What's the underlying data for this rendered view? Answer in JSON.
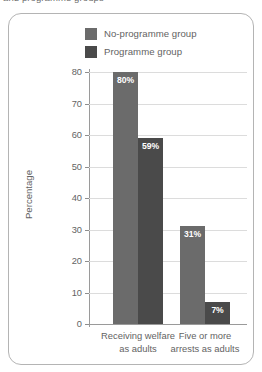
{
  "caption": {
    "partial_text": "and programme groups"
  },
  "legend": {
    "items": [
      {
        "label": "No-programme group",
        "color": "#6b6b6b",
        "swatch_name": "legend-swatch-no-programme"
      },
      {
        "label": "Programme group",
        "color": "#4a4a4a",
        "swatch_name": "legend-swatch-programme"
      }
    ]
  },
  "axes": {
    "y_title": "Percentage",
    "y_ticks": [
      "0",
      "10",
      "20",
      "30",
      "40",
      "50",
      "60",
      "70",
      "80"
    ],
    "x_categories": [
      {
        "line1": "Receiving welfare",
        "line2": "as adults"
      },
      {
        "line1": "Five or more",
        "line2": "arrests as adults"
      }
    ]
  },
  "bars": [
    {
      "group": 0,
      "series": "No-programme group",
      "value": 80,
      "label": "80%",
      "color": "#6b6b6b"
    },
    {
      "group": 0,
      "series": "Programme group",
      "value": 59,
      "label": "59%",
      "color": "#4a4a4a"
    },
    {
      "group": 1,
      "series": "No-programme group",
      "value": 31,
      "label": "31%",
      "color": "#6b6b6b"
    },
    {
      "group": 1,
      "series": "Programme group",
      "value": 7,
      "label": "7%",
      "color": "#4a4a4a"
    }
  ],
  "chart_data": {
    "type": "bar",
    "title": "",
    "xlabel": "",
    "ylabel": "Percentage",
    "ylim": [
      0,
      80
    ],
    "yticks": [
      0,
      10,
      20,
      30,
      40,
      50,
      60,
      70,
      80
    ],
    "grid": true,
    "legend_position": "top",
    "categories": [
      "Receiving welfare as adults",
      "Five or more arrests as adults"
    ],
    "series": [
      {
        "name": "No-programme group",
        "values": [
          80,
          31
        ],
        "color": "#6b6b6b",
        "data_labels": [
          "80%",
          "31%"
        ]
      },
      {
        "name": "Programme group",
        "values": [
          59,
          7
        ],
        "color": "#4a4a4a",
        "data_labels": [
          "59%",
          "7%"
        ]
      }
    ],
    "units": "percent"
  }
}
